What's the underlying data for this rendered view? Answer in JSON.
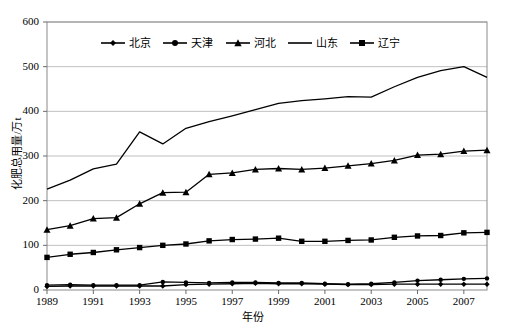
{
  "chart_data": {
    "type": "line",
    "title": "",
    "xlabel": "年份",
    "ylabel": "化肥总用量/万t",
    "xlim": [
      1989,
      2008
    ],
    "ylim": [
      0,
      600
    ],
    "ytick_labels": [
      "0",
      "100",
      "200",
      "300",
      "400",
      "500",
      "600"
    ],
    "ytick_values": [
      0,
      100,
      200,
      300,
      400,
      500,
      600
    ],
    "xtick_labels": [
      "1989",
      "1991",
      "1993",
      "1995",
      "1997",
      "1999",
      "2001",
      "2003",
      "2005",
      "2007"
    ],
    "xtick_values": [
      1989,
      1991,
      1993,
      1995,
      1997,
      1999,
      2001,
      2003,
      2005,
      2007
    ],
    "x": [
      1989,
      1990,
      1991,
      1992,
      1993,
      1994,
      1995,
      1996,
      1997,
      1998,
      1999,
      2000,
      2001,
      2002,
      2003,
      2004,
      2005,
      2006,
      2007,
      2008
    ],
    "grid": "horizontal",
    "legend_position": "top-center",
    "series": [
      {
        "name": "北京",
        "marker": "diamond",
        "color": "#000000",
        "values": [
          8,
          9,
          9,
          9,
          9,
          9,
          12,
          13,
          14,
          15,
          14,
          14,
          13,
          12,
          12,
          13,
          13,
          13,
          13,
          13
        ]
      },
      {
        "name": "天津",
        "marker": "circle",
        "color": "#000000",
        "values": [
          11,
          12,
          11,
          11,
          11,
          18,
          17,
          16,
          17,
          17,
          16,
          16,
          14,
          13,
          14,
          17,
          21,
          23,
          25,
          26
        ]
      },
      {
        "name": "河北",
        "marker": "triangle",
        "color": "#000000",
        "values": [
          135,
          144,
          160,
          162,
          193,
          218,
          219,
          259,
          262,
          270,
          272,
          270,
          273,
          278,
          283,
          290,
          302,
          304,
          311,
          313
        ]
      },
      {
        "name": "山东",
        "marker": "none",
        "color": "#000000",
        "values": [
          226,
          246,
          271,
          282,
          354,
          327,
          362,
          377,
          390,
          404,
          418,
          424,
          428,
          433,
          432,
          455,
          476,
          491,
          500,
          476
        ]
      },
      {
        "name": "辽宁",
        "marker": "square",
        "color": "#000000",
        "values": [
          73,
          80,
          84,
          90,
          95,
          100,
          103,
          110,
          113,
          114,
          116,
          109,
          109,
          111,
          112,
          118,
          121,
          122,
          128,
          129
        ]
      }
    ]
  },
  "axes": {
    "plot_left": 47,
    "plot_right": 487,
    "plot_top": 22,
    "plot_bottom": 290
  }
}
